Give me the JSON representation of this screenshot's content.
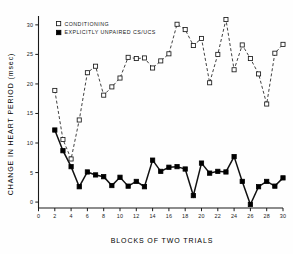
{
  "chart_data": {
    "type": "line",
    "title": "",
    "xlabel": "BLOCKS OF TWO TRIALS",
    "ylabel": "CHANGE IN HEART PERIOD (msec)",
    "xlim": [
      0,
      30
    ],
    "ylim": [
      -1,
      31.5
    ],
    "xticks": [
      0,
      2,
      4,
      6,
      8,
      10,
      12,
      14,
      16,
      18,
      20,
      22,
      24,
      26,
      28,
      30
    ],
    "yticks": [
      0,
      5,
      10,
      15,
      20,
      25,
      30
    ],
    "xtick_labels": [
      "0",
      "2",
      "4",
      "6",
      "8",
      "10",
      "12",
      "14",
      "16",
      "18",
      "20",
      "22",
      "24",
      "26",
      "28",
      "30"
    ],
    "ytick_labels": [
      "0",
      "5",
      "10",
      "15",
      "20",
      "25",
      "30"
    ],
    "grid": false,
    "legend_position": "top-left",
    "x": [
      2,
      3,
      4,
      5,
      6,
      7,
      8,
      9,
      10,
      11,
      12,
      13,
      14,
      15,
      16,
      17,
      18,
      19,
      20,
      21,
      22,
      23,
      24,
      25,
      26,
      27,
      28,
      29,
      30
    ],
    "series": [
      {
        "name": "CONDITIONING",
        "marker": "open-square",
        "linestyle": "dashed",
        "values": [
          18.9,
          10.6,
          7.3,
          13.9,
          21.9,
          23.0,
          18.1,
          19.5,
          21.0,
          24.5,
          24.3,
          24.4,
          22.7,
          23.9,
          25.1,
          30.1,
          29.2,
          26.5,
          27.7,
          20.2,
          25.0,
          30.9,
          22.4,
          26.6,
          24.3,
          21.7,
          16.6,
          25.2,
          26.7
        ]
      },
      {
        "name": "EXPLICITLY UNPAIRED CS/UCS",
        "marker": "filled-square",
        "linestyle": "solid",
        "values": [
          12.2,
          8.7,
          6.0,
          2.6,
          5.1,
          4.6,
          4.3,
          2.8,
          4.2,
          2.7,
          3.5,
          2.6,
          7.1,
          5.2,
          5.9,
          6.0,
          5.6,
          1.1,
          6.6,
          4.9,
          5.2,
          5.1,
          7.7,
          3.5,
          -0.4,
          2.6,
          3.5,
          2.7,
          4.1
        ]
      }
    ]
  },
  "legend": {
    "entries": [
      {
        "label": "CONDITIONING",
        "marker": "open-square"
      },
      {
        "label": "EXPLICITLY UNPAIRED CS/UCS",
        "marker": "filled-square"
      }
    ]
  },
  "colors": {
    "axis": "#1a1a1a",
    "series_conditioning": "#1f1f1f",
    "series_unpaired": "#000000",
    "background": "#fefefe"
  }
}
